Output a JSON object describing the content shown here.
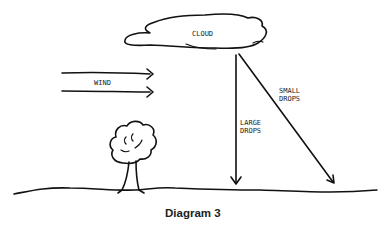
{
  "diagram": {
    "caption": "Diagram 3",
    "labels": {
      "cloud": "CLOUD",
      "wind": "WIND",
      "large_drops_1": "LARGE",
      "large_drops_2": "DROPS",
      "small_drops_1": "SMALL",
      "small_drops_2": "DROPS"
    },
    "elements": [
      "cloud",
      "wind-arrows",
      "large-drops-arrow",
      "small-drops-arrow",
      "tree",
      "ground"
    ]
  }
}
